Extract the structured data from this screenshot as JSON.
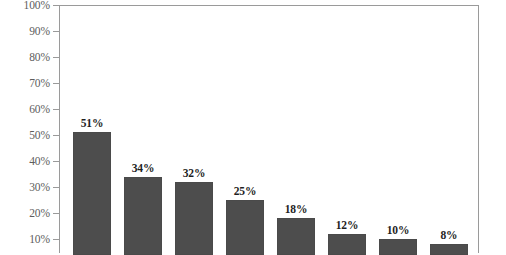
{
  "chart_data": {
    "type": "bar",
    "title": "",
    "subtitle": "",
    "xlabel": "",
    "ylabel": "",
    "categories": [
      "",
      "",
      "",
      "",
      "",
      "",
      "",
      ""
    ],
    "values": [
      51,
      34,
      32,
      25,
      18,
      12,
      10,
      8
    ],
    "value_labels": [
      "51%",
      "34%",
      "32%",
      "25%",
      "18%",
      "12%",
      "10%",
      "8%"
    ],
    "ylim": [
      0,
      100
    ],
    "y_tick_values": [
      100,
      90,
      80,
      70,
      60,
      50,
      40,
      30,
      20,
      10
    ],
    "y_tick_labels": [
      "100%",
      "90%",
      "80%",
      "70%",
      "60%",
      "50%",
      "40%",
      "30%",
      "20%",
      "10%"
    ],
    "grid": false,
    "legend": null,
    "legend_position": "none",
    "bar_color": "#4d4d4d",
    "axis_color": "#9a9a9a",
    "tick_label_color": "#5d5d5d",
    "value_label_color": "#1f1f1f",
    "background": "#ffffff",
    "note": "bottom of chart is cropped; x-axis category labels are not visible"
  }
}
